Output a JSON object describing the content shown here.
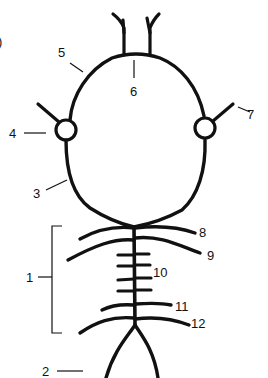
{
  "figure": {
    "panel_label_fragment": ")",
    "colors": {
      "ink": "#111111",
      "background": "#ffffff"
    }
  },
  "labels": [
    {
      "id": "1",
      "text": "1",
      "target": "bracket spanning body segments"
    },
    {
      "id": "2",
      "text": "2",
      "target": "forked tail"
    },
    {
      "id": "3",
      "text": "3",
      "target": "head outline (lower left)"
    },
    {
      "id": "4",
      "text": "4",
      "target": "left eye circle"
    },
    {
      "id": "5",
      "text": "5",
      "target": "head outline (upper left)"
    },
    {
      "id": "6",
      "text": "6",
      "target": "base of antennae on head top"
    },
    {
      "id": "7",
      "text": "7",
      "target": "right eye spine"
    },
    {
      "id": "8",
      "text": "8",
      "target": "first right appendage"
    },
    {
      "id": "9",
      "text": "9",
      "target": "second right appendage"
    },
    {
      "id": "10",
      "text": "10",
      "target": "short middle appendages"
    },
    {
      "id": "11",
      "text": "11",
      "target": "second-to-last right appendage"
    },
    {
      "id": "12",
      "text": "12",
      "target": "last right appendage"
    }
  ]
}
